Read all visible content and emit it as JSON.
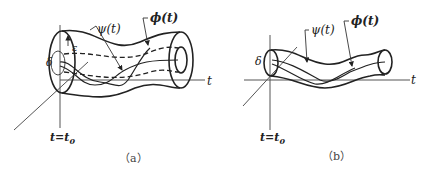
{
  "figure": {
    "panels": [
      {
        "id": "a",
        "caption": "（a）",
        "labels": {
          "psi": "ψ(t)",
          "phi": "ϕ(t)",
          "epsilon": "ε",
          "delta": "δ",
          "t_axis": "t",
          "t0": "t=t",
          "t0_sub": "0"
        }
      },
      {
        "id": "b",
        "caption": "（b）",
        "labels": {
          "psi": "ψ(t)",
          "phi": "ϕ(t)",
          "delta": "δ",
          "t_axis": "t",
          "t0": "t=t",
          "t0_sub": "0"
        }
      }
    ]
  }
}
